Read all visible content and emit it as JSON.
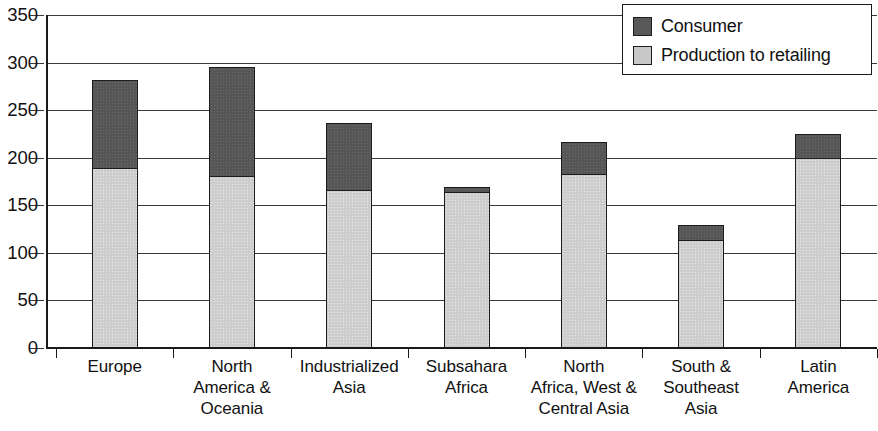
{
  "chart_data": {
    "type": "bar",
    "subtype": "stacked-bar",
    "title": "",
    "xlabel": "",
    "ylabel": "",
    "ylim": [
      0,
      350
    ],
    "yticks": [
      0,
      50,
      100,
      150,
      200,
      250,
      300,
      350
    ],
    "grid": true,
    "legend_position": "top-right",
    "categories": [
      "Europe",
      "North America & Oceania",
      "Industrialized Asia",
      "Subsahara Africa",
      "North Africa, West & Central Asia",
      "South & Southeast Asia",
      "Latin America"
    ],
    "category_lines": [
      [
        "Europe"
      ],
      [
        "North",
        "America &",
        "Oceania"
      ],
      [
        "Industrialized",
        "Asia"
      ],
      [
        "Subsahara",
        "Africa"
      ],
      [
        "North",
        "Africa, West &",
        "Central Asia"
      ],
      [
        "South &",
        "Southeast",
        "Asia"
      ],
      [
        "Latin",
        "America"
      ]
    ],
    "series": [
      {
        "name": "Production to retailing",
        "color": "#cdcdcd",
        "values": [
          190,
          181,
          166,
          164,
          183,
          114,
          200
        ]
      },
      {
        "name": "Consumer",
        "color": "#565656",
        "values": [
          92,
          114,
          71,
          5,
          34,
          15,
          25
        ]
      }
    ],
    "totals": [
      282,
      295,
      237,
      169,
      217,
      129,
      225
    ]
  },
  "legend": {
    "items": [
      {
        "label": "Consumer",
        "color": "#595959"
      },
      {
        "label": "Production to retailing",
        "color": "#c8c8c8"
      }
    ]
  },
  "axis": {
    "y_tick_labels": [
      "350",
      "300",
      "250",
      "200",
      "150",
      "100",
      "50",
      "0"
    ],
    "y_tick_values": [
      350,
      300,
      250,
      200,
      150,
      100,
      50,
      0
    ]
  }
}
